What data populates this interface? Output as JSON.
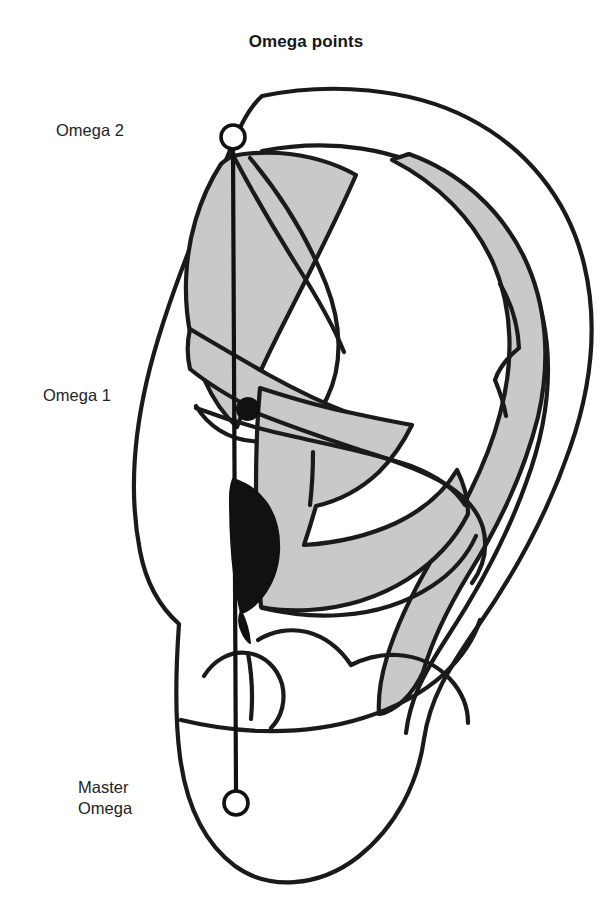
{
  "figure": {
    "title": "Omega points",
    "kind": "auricular-acupuncture-ear-map",
    "background_color": "#ffffff",
    "ink_color": "#1a1a1a",
    "zone_fill_color": "#c9c9c9",
    "point_fill_color": "#111111"
  },
  "labels": {
    "omega2": "Omega 2",
    "omega1": "Omega 1",
    "master_omega": "Master\nOmega"
  },
  "points": [
    {
      "id": "omega2",
      "label": "Omega 2",
      "marker": "open-circle",
      "marker_icon": "open-circle-icon",
      "x": 233,
      "y": 137,
      "radius": 12
    },
    {
      "id": "omega1",
      "label": "Omega 1",
      "marker": "filled-circle",
      "marker_icon": "filled-circle-icon",
      "x": 248,
      "y": 409,
      "radius": 11
    },
    {
      "id": "master_omega",
      "label": "Master Omega",
      "marker": "open-circle",
      "marker_icon": "open-circle-icon",
      "x": 236,
      "y": 803,
      "radius": 12
    }
  ],
  "axis": {
    "name": "omega-reference-line",
    "from": {
      "x": 233,
      "y": 149
    },
    "to": {
      "x": 236,
      "y": 791
    },
    "color": "#111111"
  }
}
